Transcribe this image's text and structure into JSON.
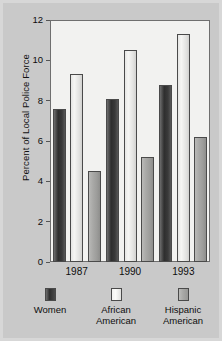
{
  "chart_data": {
    "type": "bar",
    "title": "",
    "subtitle": "",
    "xlabel": "",
    "ylabel": "Percent of Local Police Force",
    "categories": [
      "1987",
      "1990",
      "1993"
    ],
    "series": [
      {
        "name": "Women",
        "values": [
          7.6,
          8.1,
          8.8
        ],
        "color": "#3a3a3a"
      },
      {
        "name": "African American",
        "values": [
          9.3,
          10.5,
          11.3
        ],
        "color": "#f2f2f0"
      },
      {
        "name": "Hispanic American",
        "values": [
          4.5,
          5.2,
          6.2
        ],
        "color": "#a5a5a3"
      }
    ],
    "ylim": [
      0,
      12
    ],
    "yticks": [
      0,
      2,
      4,
      6,
      8,
      10,
      12
    ],
    "ytick_labels": [
      "0",
      "2",
      "4",
      "6",
      "8",
      "10",
      "12"
    ],
    "grid": false,
    "legend_position": "bottom",
    "plot_background": "#f2f2f0",
    "figure_background": "#c9c9c9",
    "axis_color": "#6f6f6f"
  },
  "legend": {
    "entries": [
      {
        "label_line1": "Women",
        "label_line2": ""
      },
      {
        "label_line1": "African",
        "label_line2": "American"
      },
      {
        "label_line1": "Hispanic",
        "label_line2": "American"
      }
    ]
  }
}
